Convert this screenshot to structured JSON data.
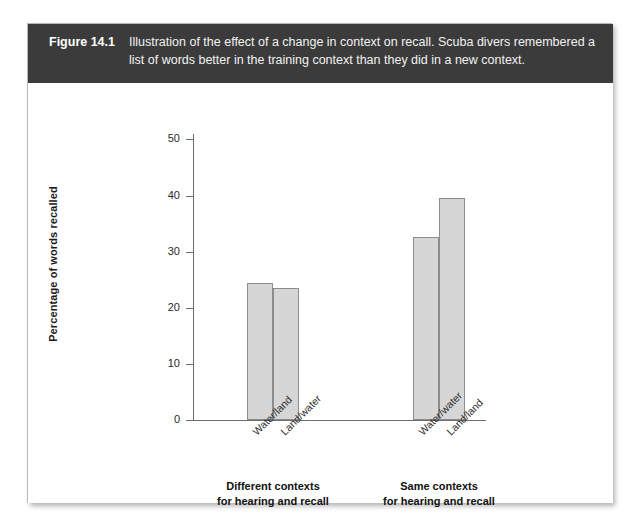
{
  "figure": {
    "number": "Figure 14.1",
    "caption": "Illustration of the effect of a change in context on recall. Scuba divers remembered a list of words better in the training context than they did in a new context."
  },
  "chart_data": {
    "type": "bar",
    "title": "Illustration of the effect of a change in context on recall",
    "xlabel": "",
    "ylabel": "Percentage of words recalled",
    "ylim": [
      0,
      50
    ],
    "yticks": [
      0,
      10,
      20,
      30,
      40,
      50
    ],
    "ytick_labels": [
      "0",
      "10",
      "20",
      "30",
      "40",
      "50"
    ],
    "grid": false,
    "legend": "none",
    "categories": [
      "Water/land",
      "Land/water",
      "Water/water",
      "Land/land"
    ],
    "values": [
      24.3,
      23.4,
      32.5,
      39.5
    ],
    "groups": [
      {
        "label_line1": "Different contexts",
        "label_line2": "for hearing and recall",
        "categories": [
          "Water/land",
          "Land/water"
        ]
      },
      {
        "label_line1": "Same contexts",
        "label_line2": "for hearing and recall",
        "categories": [
          "Water/water",
          "Land/land"
        ]
      }
    ],
    "colors": {
      "bar_fill": "#d6d6d6",
      "bar_border": "#8c8c8c",
      "axis": "#6d6d6d",
      "header_bg": "#3b3b3b",
      "header_text": "#f2f2f2"
    }
  }
}
